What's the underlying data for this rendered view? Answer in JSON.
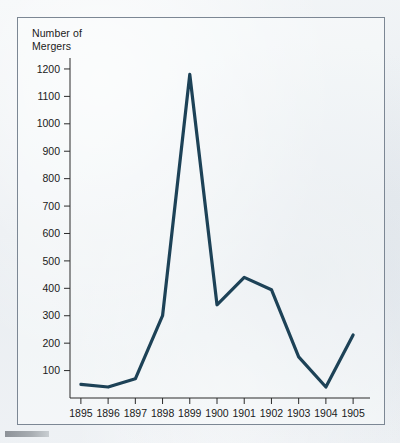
{
  "figure": {
    "axis_title": "Number of\nMergers",
    "line_color": "#1d4257",
    "frame_color": "#7c8794",
    "axis_color": "#2a2a2a",
    "background_color": "#eef1f4",
    "bottom_rule_color": "#8d9298"
  },
  "chart_data": {
    "type": "line",
    "title": "",
    "subtitle": "",
    "xlabel": "",
    "ylabel": "Number of Mergers",
    "categories": [
      "1895",
      "1896",
      "1897",
      "1898",
      "1899",
      "1900",
      "1901",
      "1902",
      "1903",
      "1904",
      "1905"
    ],
    "x": [
      1895,
      1896,
      1897,
      1898,
      1899,
      1900,
      1901,
      1902,
      1903,
      1904,
      1905
    ],
    "values": [
      50,
      40,
      70,
      300,
      1180,
      340,
      440,
      395,
      150,
      40,
      230
    ],
    "series": [
      {
        "name": "Number of Mergers",
        "values": [
          50,
          40,
          70,
          300,
          1180,
          340,
          440,
          395,
          150,
          40,
          230
        ]
      }
    ],
    "ylim": [
      0,
      1240
    ],
    "xlim": [
      1894.6,
      1905.4
    ],
    "yticks": [
      100,
      200,
      300,
      400,
      500,
      600,
      700,
      800,
      900,
      1000,
      1100,
      1200
    ],
    "ytick_labels": [
      "100",
      "200",
      "300",
      "400",
      "500",
      "600",
      "700",
      "800",
      "900",
      "1000",
      "1100",
      "1200"
    ],
    "xticks": [
      1895,
      1896,
      1897,
      1898,
      1899,
      1900,
      1901,
      1902,
      1903,
      1904,
      1905
    ],
    "xtick_labels": [
      "1895",
      "1896",
      "1897",
      "1898",
      "1899",
      "1900",
      "1901",
      "1902",
      "1903",
      "1904",
      "1905"
    ],
    "grid": false,
    "legend": false,
    "legend_position": "none",
    "annotations": []
  }
}
